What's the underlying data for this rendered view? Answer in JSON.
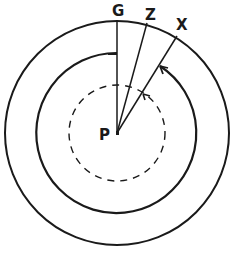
{
  "diagram": {
    "labels": {
      "center": "P",
      "line_g": "G",
      "line_z": "Z",
      "line_x": "X"
    },
    "center": {
      "x": 117,
      "y": 133
    },
    "circles": {
      "outer_radius": 112,
      "middle_radius": 80,
      "dashed_radius": 48
    },
    "colors": {
      "stroke": "#1a1a1a",
      "background": "#ffffff"
    }
  }
}
